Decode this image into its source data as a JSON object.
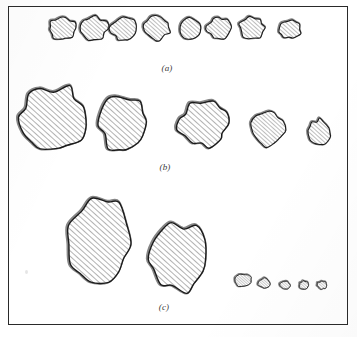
{
  "figure": {
    "type": "scientific-figure-plate",
    "frame": {
      "x": 8,
      "y": 6,
      "width": 340,
      "height": 319,
      "border_color": "#2a2a2a"
    },
    "page_background": "#ffffff",
    "outline_color": "#1a1a1a",
    "hatch_color": "#4a4a4a",
    "hatch_angle_deg": 45,
    "shadow_color": "#222222",
    "rows": [
      {
        "id": "a",
        "label": "(a)",
        "label_x": 167,
        "label_y": 63,
        "shape_count": 8,
        "shapes": [
          {
            "name": "shape-a1",
            "cx": 62,
            "cy": 28,
            "rx": 14,
            "ry": 12,
            "seed": 11
          },
          {
            "name": "shape-a2",
            "cx": 93,
            "cy": 28,
            "rx": 15,
            "ry": 12,
            "seed": 23
          },
          {
            "name": "shape-a3",
            "cx": 124,
            "cy": 29,
            "rx": 14,
            "ry": 12,
            "seed": 37
          },
          {
            "name": "shape-a4",
            "cx": 157,
            "cy": 28,
            "rx": 13,
            "ry": 12,
            "seed": 41
          },
          {
            "name": "shape-a5",
            "cx": 189,
            "cy": 29,
            "rx": 11,
            "ry": 11,
            "seed": 53
          },
          {
            "name": "shape-a6",
            "cx": 219,
            "cy": 28,
            "rx": 12,
            "ry": 11,
            "seed": 67
          },
          {
            "name": "shape-a7",
            "cx": 252,
            "cy": 28,
            "rx": 13,
            "ry": 11,
            "seed": 71
          },
          {
            "name": "shape-a8",
            "cx": 290,
            "cy": 29,
            "rx": 11,
            "ry": 10,
            "seed": 89
          }
        ]
      },
      {
        "id": "b",
        "label": "(b)",
        "label_x": 165,
        "label_y": 162,
        "shape_count": 5,
        "shapes": [
          {
            "name": "shape-b1",
            "cx": 55,
            "cy": 119,
            "rx": 35,
            "ry": 33,
            "seed": 101
          },
          {
            "name": "shape-b2",
            "cx": 123,
            "cy": 124,
            "rx": 24,
            "ry": 28,
            "seed": 113
          },
          {
            "name": "shape-b3",
            "cx": 203,
            "cy": 124,
            "rx": 25,
            "ry": 23,
            "seed": 127
          },
          {
            "name": "shape-b4",
            "cx": 268,
            "cy": 129,
            "rx": 17,
            "ry": 17,
            "seed": 139
          },
          {
            "name": "shape-b5",
            "cx": 320,
            "cy": 132,
            "rx": 11,
            "ry": 13,
            "seed": 149
          }
        ]
      },
      {
        "id": "c",
        "label": "(c)",
        "label_x": 164,
        "label_y": 302,
        "shape_count": 7,
        "shapes": [
          {
            "name": "shape-c1",
            "cx": 100,
            "cy": 242,
            "rx": 32,
            "ry": 44,
            "seed": 151
          },
          {
            "name": "shape-c2",
            "cx": 178,
            "cy": 257,
            "rx": 29,
            "ry": 36,
            "seed": 163
          },
          {
            "name": "shape-c3",
            "cx": 243,
            "cy": 280,
            "rx": 8,
            "ry": 7,
            "seed": 173
          },
          {
            "name": "shape-c4",
            "cx": 264,
            "cy": 283,
            "rx": 6,
            "ry": 5,
            "seed": 181
          },
          {
            "name": "shape-c5",
            "cx": 285,
            "cy": 285,
            "rx": 5,
            "ry": 4,
            "seed": 191
          },
          {
            "name": "shape-c6",
            "cx": 304,
            "cy": 285,
            "rx": 5,
            "ry": 4,
            "seed": 197
          },
          {
            "name": "shape-c7",
            "cx": 322,
            "cy": 285,
            "rx": 5,
            "ry": 4,
            "seed": 199
          }
        ]
      }
    ],
    "specks": [
      {
        "x": 25,
        "y": 270
      }
    ]
  }
}
